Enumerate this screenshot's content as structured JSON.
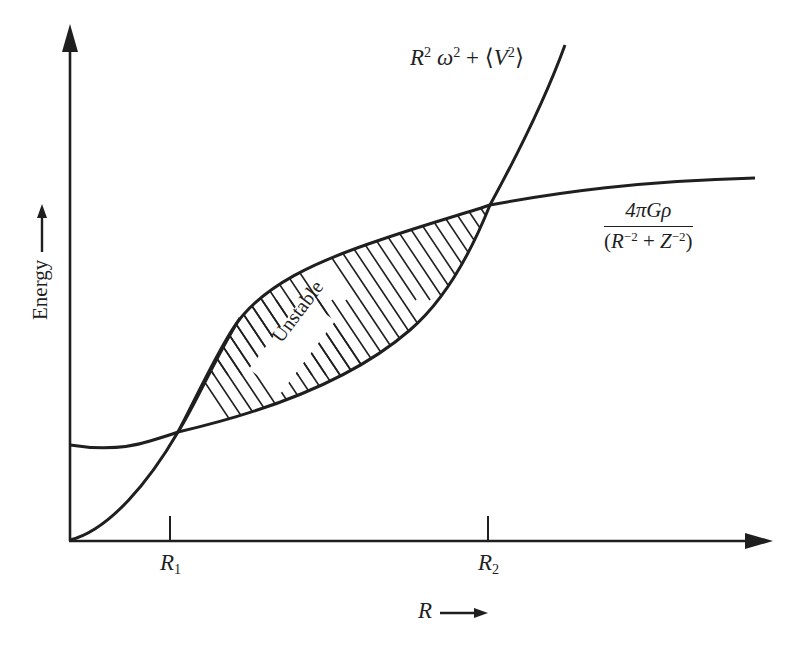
{
  "figure": {
    "type": "schematic energy diagram",
    "axes": {
      "x_label": "R",
      "y_label": "Energy",
      "x_arrow": true,
      "y_arrow": true,
      "ticks": [
        {
          "label_base": "R",
          "label_sub": "1",
          "x": 170
        },
        {
          "label_base": "R",
          "label_sub": "2",
          "x": 488
        }
      ]
    },
    "curves": [
      {
        "id": "kinetic",
        "label_parts": {
          "t1": "R",
          "s1": "2",
          "t2": " ω",
          "s2": "2",
          "t3": " + ⟨",
          "t4": "V",
          "s3": "2",
          "t5": "⟩"
        },
        "label": "R² ω² + ⟨V²⟩",
        "description": "rises from origin, S-shaped, steep after R2"
      },
      {
        "id": "gravitational",
        "label_numerator": "4πGρ",
        "label_denominator_parts": {
          "t1": "(",
          "t2": "R",
          "s1": "−2",
          "t3": " + ",
          "t4": "Z",
          "s2": "−2",
          "t5": ")"
        },
        "label": "4πGρ / (R⁻² + Z⁻²)",
        "description": "starts above origin with shallow minimum, rises and saturates"
      }
    ],
    "region": {
      "label": "Unstable",
      "between": [
        "R1",
        "R2"
      ],
      "fill": "diagonal hatching"
    },
    "colors": {
      "ink": "#1f1f1f",
      "background": "#ffffff"
    }
  }
}
